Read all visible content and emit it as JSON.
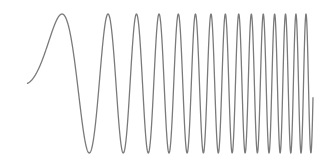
{
  "chart_data": {
    "type": "line",
    "title": "",
    "xlabel": "",
    "ylabel": "",
    "grid": false,
    "legend": null,
    "axes_visible": false,
    "series": [
      {
        "name": "chirp",
        "color": "#7a7a7a",
        "function": "sin(a*t + b*t^2)",
        "params": {
          "a": 0.005286,
          "b": 0.0011313
        },
        "t_range": [
          0,
          286
        ],
        "approx_peak_count": 15,
        "approx_peak_x_px": [
          62,
          108,
          136,
          158,
          179,
          196,
          211,
          226,
          239,
          252,
          263,
          274,
          285,
          296,
          306
        ]
      }
    ],
    "pixel_frame": {
      "x0": 27,
      "y_center": 83.5,
      "amplitude": 69.5
    }
  }
}
